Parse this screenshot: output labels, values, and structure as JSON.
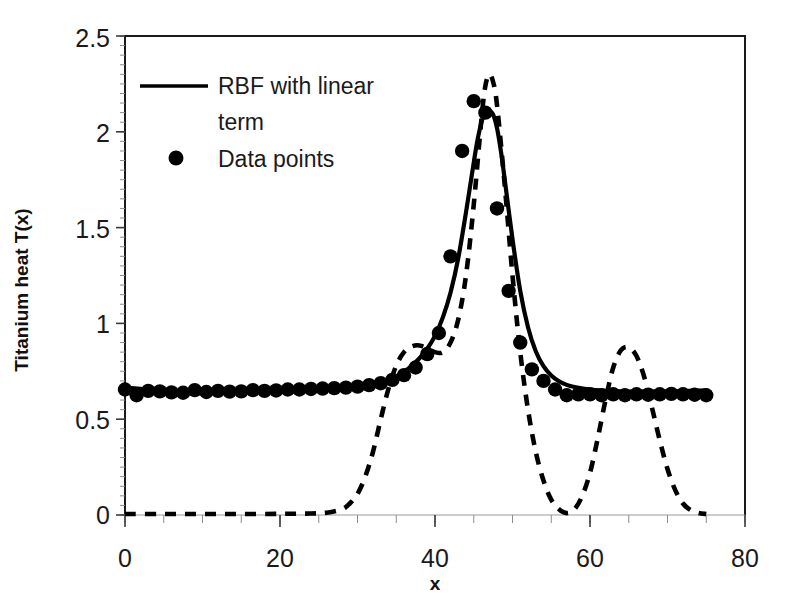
{
  "chart_data": {
    "type": "line",
    "title": "",
    "xlabel": "x",
    "ylabel": "Titanium heat T(x)",
    "xlim": [
      0,
      80
    ],
    "ylim": [
      0,
      2.5
    ],
    "xticks": [
      0,
      20,
      40,
      60,
      80
    ],
    "yticks": [
      0,
      0.5,
      1,
      1.5,
      2,
      2.5
    ],
    "xtick_labels": [
      "0",
      "20",
      "40",
      "60",
      "80"
    ],
    "ytick_labels": [
      "0",
      "0.5",
      "1",
      "1.5",
      "2",
      "2.5"
    ],
    "x_minor_tick_step": 5,
    "y_minor_tick_step": 0.05,
    "grid": false,
    "legend_position": "upper-left-inside",
    "legend": [
      {
        "label": "RBF with linear term",
        "marker": "line-solid"
      },
      {
        "label": "Data points",
        "marker": "dot"
      }
    ],
    "series": [
      {
        "name": "RBF with linear term",
        "style": "solid",
        "x": [
          0,
          2,
          4,
          6,
          8,
          10,
          12,
          14,
          16,
          18,
          20,
          22,
          24,
          26,
          28,
          30,
          31,
          32,
          33,
          34,
          35,
          36,
          37,
          38,
          39,
          40,
          41,
          42,
          43,
          44,
          45,
          45.5,
          46,
          46.5,
          47,
          47.5,
          48,
          48.5,
          49,
          50,
          51,
          52,
          53,
          54,
          55,
          56,
          57,
          58,
          60,
          62,
          64,
          66,
          68,
          70,
          72,
          74,
          75
        ],
        "y": [
          0.665,
          0.658,
          0.652,
          0.648,
          0.645,
          0.643,
          0.642,
          0.641,
          0.641,
          0.642,
          0.643,
          0.645,
          0.648,
          0.652,
          0.658,
          0.667,
          0.673,
          0.681,
          0.692,
          0.706,
          0.724,
          0.748,
          0.779,
          0.818,
          0.868,
          0.935,
          1.03,
          1.16,
          1.34,
          1.58,
          1.84,
          1.96,
          2.05,
          2.1,
          2.11,
          2.09,
          2.02,
          1.9,
          1.75,
          1.44,
          1.17,
          0.98,
          0.855,
          0.777,
          0.728,
          0.698,
          0.679,
          0.668,
          0.654,
          0.648,
          0.645,
          0.644,
          0.644,
          0.645,
          0.647,
          0.649,
          0.65
        ]
      },
      {
        "name": "RBF without linear term",
        "style": "dashed",
        "x": [
          0,
          5,
          10,
          15,
          20,
          24,
          26,
          28,
          29,
          30,
          31,
          32,
          33,
          34,
          35,
          36,
          37,
          38,
          39,
          40,
          41,
          42,
          43,
          44,
          45,
          46,
          46.5,
          47,
          47.5,
          48,
          49,
          50,
          51,
          52,
          53,
          54,
          55,
          56,
          57,
          58,
          59,
          60,
          61,
          62,
          63,
          64,
          65,
          66,
          67,
          68,
          69,
          70,
          71,
          72,
          73,
          74,
          75
        ],
        "y": [
          0.005,
          0.005,
          0.005,
          0.005,
          0.006,
          0.008,
          0.012,
          0.03,
          0.06,
          0.11,
          0.2,
          0.33,
          0.5,
          0.66,
          0.78,
          0.85,
          0.88,
          0.885,
          0.87,
          0.85,
          0.85,
          0.9,
          1.02,
          1.25,
          1.62,
          2.07,
          2.24,
          2.3,
          2.26,
          2.14,
          1.72,
          1.25,
          0.85,
          0.55,
          0.33,
          0.18,
          0.08,
          0.03,
          0.01,
          0.03,
          0.1,
          0.22,
          0.4,
          0.6,
          0.77,
          0.86,
          0.875,
          0.83,
          0.72,
          0.56,
          0.39,
          0.24,
          0.13,
          0.06,
          0.025,
          0.01,
          0.005
        ]
      }
    ],
    "data_points": {
      "name": "Data points",
      "x": [
        0,
        1.5,
        3,
        4.5,
        6,
        7.5,
        9,
        10.5,
        12,
        13.5,
        15,
        16.5,
        18,
        19.5,
        21,
        22.5,
        24,
        25.5,
        27,
        28.5,
        30,
        31.5,
        33,
        34.5,
        36,
        37.5,
        39,
        40.5,
        42,
        43.5,
        45,
        46.5,
        48,
        49.5,
        51,
        52.5,
        54,
        55.5,
        57,
        58.5,
        60,
        61.5,
        63,
        64.5,
        66,
        67.5,
        69,
        70.5,
        72,
        73.5,
        75
      ],
      "y": [
        0.655,
        0.625,
        0.648,
        0.645,
        0.64,
        0.638,
        0.652,
        0.642,
        0.648,
        0.644,
        0.645,
        0.652,
        0.648,
        0.65,
        0.655,
        0.655,
        0.658,
        0.66,
        0.662,
        0.665,
        0.67,
        0.678,
        0.688,
        0.705,
        0.73,
        0.77,
        0.84,
        0.95,
        1.35,
        1.9,
        2.16,
        2.1,
        1.6,
        1.17,
        0.9,
        0.76,
        0.7,
        0.655,
        0.625,
        0.63,
        0.63,
        0.625,
        0.63,
        0.625,
        0.63,
        0.628,
        0.63,
        0.632,
        0.63,
        0.628,
        0.625
      ]
    }
  },
  "axis": {
    "ylabel": "Titanium heat T(x)",
    "xlabel": "x",
    "ytick_0": "0",
    "ytick_1": "0.5",
    "ytick_2": "1",
    "ytick_3": "1.5",
    "ytick_4": "2",
    "ytick_5": "2.5",
    "xtick_0": "0",
    "xtick_1": "20",
    "xtick_2": "40",
    "xtick_3": "60",
    "xtick_4": "80"
  },
  "legend": {
    "item_0_label": "RBF with linear term",
    "item_0_line_1": "RBF with linear",
    "item_0_line_2": "term",
    "item_1_label": "Data points"
  },
  "colors": {
    "line": "#000000",
    "text": "#1a1a1a",
    "frame": "#1a1a1a",
    "minor_tick": "#8c8c8c"
  }
}
